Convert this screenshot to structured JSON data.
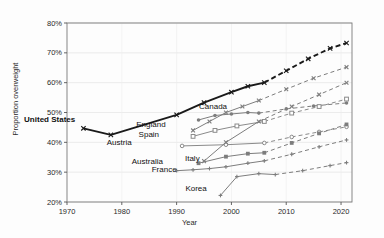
{
  "chart_data": {
    "type": "line",
    "title": "",
    "xlabel": "Year",
    "ylabel": "Proportion overweight",
    "xlim": [
      1970,
      2022
    ],
    "ylim": [
      0.2,
      0.8
    ],
    "xticks": [
      1970,
      1980,
      1990,
      2000,
      2010,
      2020
    ],
    "xtick_labels": [
      "1970",
      "1980",
      "1990",
      "2000",
      "2010",
      "2020"
    ],
    "yticks": [
      0.2,
      0.3,
      0.4,
      0.5,
      0.6,
      0.7,
      0.8
    ],
    "ytick_labels": [
      "20%",
      "30%",
      "40%",
      "50%",
      "60%",
      "70%",
      "80%"
    ],
    "grid": true,
    "legend": "inline-series-labels",
    "projection_note": "Solid segments are observed data; dashed segments are projections",
    "series": [
      {
        "name": "United States",
        "label": "United States",
        "emphasis": true,
        "color": "#1a1a1a",
        "marker": "x",
        "label_x": 1971.5,
        "label_y": 0.468,
        "observed": [
          {
            "x": 1973,
            "y": 0.447
          },
          {
            "x": 1978,
            "y": 0.425
          },
          {
            "x": 1990,
            "y": 0.492
          },
          {
            "x": 1995,
            "y": 0.533
          },
          {
            "x": 2000,
            "y": 0.568
          },
          {
            "x": 2003,
            "y": 0.588
          },
          {
            "x": 2006,
            "y": 0.6
          }
        ],
        "projected": [
          {
            "x": 2006,
            "y": 0.6
          },
          {
            "x": 2010,
            "y": 0.64
          },
          {
            "x": 2014,
            "y": 0.68
          },
          {
            "x": 2018,
            "y": 0.715
          },
          {
            "x": 2021,
            "y": 0.733
          }
        ]
      },
      {
        "name": "England",
        "label": "England",
        "emphasis": false,
        "color": "#7d7d7d",
        "marker": "x",
        "label_x": 1988.0,
        "label_y": 0.452,
        "observed": [
          {
            "x": 1993,
            "y": 0.44
          },
          {
            "x": 1996,
            "y": 0.47
          },
          {
            "x": 1999,
            "y": 0.5
          },
          {
            "x": 2002,
            "y": 0.52
          },
          {
            "x": 2005,
            "y": 0.54
          }
        ],
        "projected": [
          {
            "x": 2005,
            "y": 0.54
          },
          {
            "x": 2010,
            "y": 0.578
          },
          {
            "x": 2015,
            "y": 0.615
          },
          {
            "x": 2021,
            "y": 0.652
          }
        ]
      },
      {
        "name": "Canada",
        "label": "Canada",
        "emphasis": false,
        "color": "#7d7d7d",
        "marker": "circle",
        "label_x": 1999.2,
        "label_y": 0.513,
        "observed": [
          {
            "x": 1994,
            "y": 0.475
          },
          {
            "x": 1997,
            "y": 0.49
          },
          {
            "x": 2000,
            "y": 0.495
          },
          {
            "x": 2003,
            "y": 0.5
          },
          {
            "x": 2005,
            "y": 0.498
          }
        ],
        "projected": [
          {
            "x": 2005,
            "y": 0.498
          },
          {
            "x": 2010,
            "y": 0.512
          },
          {
            "x": 2015,
            "y": 0.522
          },
          {
            "x": 2021,
            "y": 0.532
          }
        ]
      },
      {
        "name": "Spain",
        "label": "Spain",
        "emphasis": false,
        "color": "#8a8a8a",
        "marker": "square-open",
        "label_x": 1986.8,
        "label_y": 0.418,
        "observed": [
          {
            "x": 1993,
            "y": 0.42
          },
          {
            "x": 1997,
            "y": 0.44
          },
          {
            "x": 2001,
            "y": 0.455
          },
          {
            "x": 2006,
            "y": 0.47
          }
        ],
        "projected": [
          {
            "x": 2006,
            "y": 0.47
          },
          {
            "x": 2011,
            "y": 0.498
          },
          {
            "x": 2016,
            "y": 0.52
          },
          {
            "x": 2021,
            "y": 0.545
          }
        ]
      },
      {
        "name": "Austria",
        "label": "Austria",
        "emphasis": false,
        "color": "#8a8a8a",
        "marker": "circle-open",
        "label_x": 1981.8,
        "label_y": 0.392,
        "observed": [
          {
            "x": 1991,
            "y": 0.388
          },
          {
            "x": 1999,
            "y": 0.392
          },
          {
            "x": 2006,
            "y": 0.398
          }
        ],
        "projected": [
          {
            "x": 2006,
            "y": 0.398
          },
          {
            "x": 2011,
            "y": 0.418
          },
          {
            "x": 2016,
            "y": 0.435
          },
          {
            "x": 2021,
            "y": 0.452
          }
        ]
      },
      {
        "name": "Australia",
        "label": "Australia",
        "emphasis": false,
        "color": "#7d7d7d",
        "marker": "x",
        "label_x": 1987.5,
        "label_y": 0.326,
        "observed": [
          {
            "x": 1995,
            "y": 0.337
          },
          {
            "x": 1999,
            "y": 0.4
          },
          {
            "x": 2005,
            "y": 0.47
          }
        ],
        "projected": [
          {
            "x": 2005,
            "y": 0.47
          },
          {
            "x": 2011,
            "y": 0.52
          },
          {
            "x": 2016,
            "y": 0.56
          },
          {
            "x": 2021,
            "y": 0.6
          }
        ]
      },
      {
        "name": "Italy",
        "label": "Italy",
        "emphasis": false,
        "color": "#7d7d7d",
        "marker": "square",
        "label_x": 1994.2,
        "label_y": 0.338,
        "observed": [
          {
            "x": 1994,
            "y": 0.33
          },
          {
            "x": 1999,
            "y": 0.352
          },
          {
            "x": 2003,
            "y": 0.362
          },
          {
            "x": 2006,
            "y": 0.365
          }
        ],
        "projected": [
          {
            "x": 2006,
            "y": 0.365
          },
          {
            "x": 2011,
            "y": 0.398
          },
          {
            "x": 2016,
            "y": 0.43
          },
          {
            "x": 2021,
            "y": 0.46
          }
        ]
      },
      {
        "name": "France",
        "label": "France",
        "emphasis": false,
        "color": "#7d7d7d",
        "marker": "plus",
        "label_x": 1990.0,
        "label_y": 0.3,
        "observed": [
          {
            "x": 1990,
            "y": 0.305
          },
          {
            "x": 1993,
            "y": 0.308
          },
          {
            "x": 1996,
            "y": 0.312
          },
          {
            "x": 1999,
            "y": 0.318
          },
          {
            "x": 2003,
            "y": 0.33
          },
          {
            "x": 2006,
            "y": 0.338
          }
        ],
        "projected": [
          {
            "x": 2006,
            "y": 0.338
          },
          {
            "x": 2011,
            "y": 0.36
          },
          {
            "x": 2016,
            "y": 0.385
          },
          {
            "x": 2021,
            "y": 0.408
          }
        ]
      },
      {
        "name": "Korea",
        "label": "Korea",
        "emphasis": false,
        "color": "#7d7d7d",
        "marker": "plus",
        "label_x": 1995.5,
        "label_y": 0.238,
        "observed": [
          {
            "x": 1998,
            "y": 0.222
          },
          {
            "x": 2001,
            "y": 0.285
          },
          {
            "x": 2005,
            "y": 0.295
          },
          {
            "x": 2008,
            "y": 0.292
          }
        ],
        "projected": [
          {
            "x": 2008,
            "y": 0.292
          },
          {
            "x": 2013,
            "y": 0.305
          },
          {
            "x": 2018,
            "y": 0.322
          },
          {
            "x": 2021,
            "y": 0.332
          }
        ]
      }
    ]
  }
}
